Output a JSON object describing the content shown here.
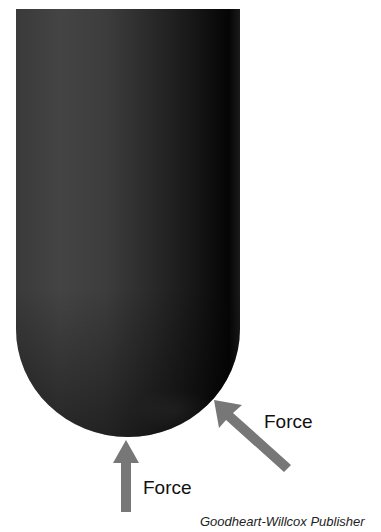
{
  "figure": {
    "object": "rounded-end-rod",
    "colors": {
      "rod": "#2a2a2a",
      "arrow": "#777777",
      "text": "#111111",
      "background": "#ffffff"
    },
    "arrows": [
      {
        "id": "bottom-force",
        "label": "Force",
        "direction": "up"
      },
      {
        "id": "angled-force",
        "label": "Force",
        "direction": "up-left"
      }
    ],
    "credit": "Goodheart-Willcox Publisher"
  }
}
